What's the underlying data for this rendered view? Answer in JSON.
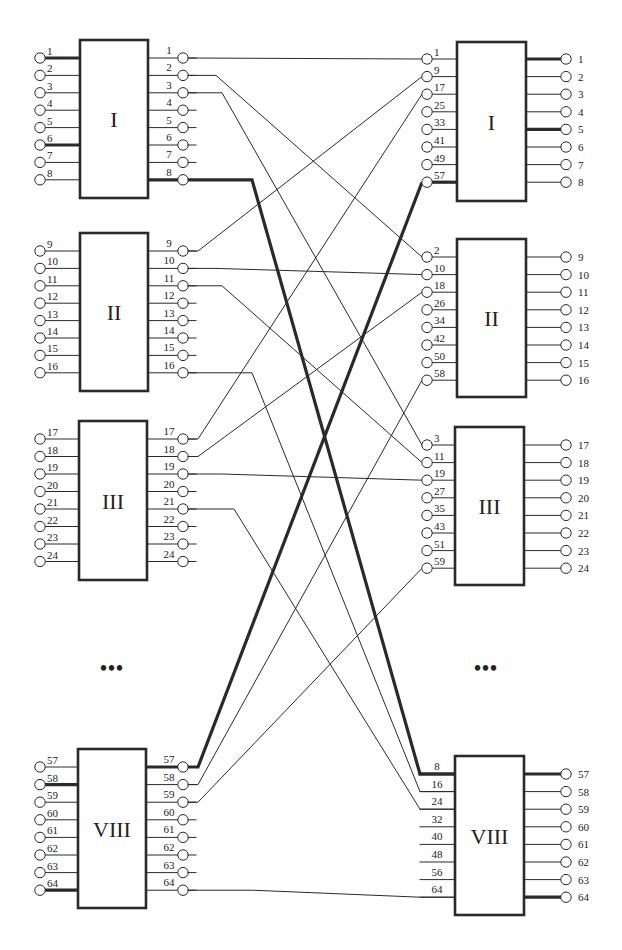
{
  "diagram": {
    "title": "",
    "colors": {
      "stroke": "#2a2a2a",
      "background": "#ffffff"
    },
    "ellipsis": "•••",
    "left_blocks": [
      {
        "label": "I",
        "box": [
          80,
          40,
          148,
          198
        ],
        "first": 58,
        "step": 17.4,
        "inputs": [
          1,
          2,
          3,
          4,
          5,
          6,
          7,
          8
        ],
        "outputs": [
          1,
          2,
          3,
          4,
          5,
          6,
          7,
          8
        ],
        "thick_in": [
          1,
          6
        ],
        "thick_out": [
          8
        ]
      },
      {
        "label": "II",
        "box": [
          80,
          233,
          148,
          391
        ],
        "first": 251,
        "step": 17.4,
        "inputs": [
          9,
          10,
          11,
          12,
          13,
          14,
          15,
          16
        ],
        "outputs": [
          9,
          10,
          11,
          12,
          13,
          14,
          15,
          16
        ],
        "thick_in": [],
        "thick_out": []
      },
      {
        "label": "III",
        "box": [
          79,
          421,
          147,
          580
        ],
        "first": 439,
        "step": 17.5,
        "inputs": [
          17,
          18,
          19,
          20,
          21,
          22,
          23,
          24
        ],
        "outputs": [
          17,
          18,
          19,
          20,
          21,
          22,
          23,
          24
        ],
        "thick_in": [],
        "thick_out": []
      },
      {
        "label": "VIII",
        "box": [
          78,
          749,
          146,
          908
        ],
        "first": 767,
        "step": 17.6,
        "inputs": [
          57,
          58,
          59,
          60,
          61,
          62,
          63,
          64
        ],
        "outputs": [
          57,
          58,
          59,
          60,
          61,
          62,
          63,
          64
        ],
        "thick_in": [
          58,
          64
        ],
        "thick_out": [
          57
        ]
      }
    ],
    "right_blocks": [
      {
        "label": "I",
        "box": [
          457,
          42,
          526,
          201
        ],
        "first": 59,
        "step": 17.6,
        "inputs": [
          1,
          9,
          17,
          25,
          33,
          41,
          49,
          57
        ],
        "outputs": [
          1,
          2,
          3,
          4,
          5,
          6,
          7,
          8
        ],
        "thick_in": [
          57
        ],
        "thick_out": [
          1,
          5
        ],
        "input_circles": true
      },
      {
        "label": "II",
        "box": [
          457,
          239,
          526,
          397
        ],
        "first": 257,
        "step": 17.6,
        "inputs": [
          2,
          10,
          18,
          26,
          34,
          42,
          50,
          58
        ],
        "outputs": [
          9,
          10,
          11,
          12,
          13,
          14,
          15,
          16
        ],
        "thick_in": [],
        "thick_out": [],
        "input_circles": true
      },
      {
        "label": "III",
        "box": [
          455,
          427,
          524,
          585
        ],
        "first": 445,
        "step": 17.6,
        "inputs": [
          3,
          11,
          19,
          27,
          35,
          43,
          51,
          59
        ],
        "outputs": [
          17,
          18,
          19,
          20,
          21,
          22,
          23,
          24
        ],
        "thick_in": [],
        "thick_out": [],
        "input_circles": true
      },
      {
        "label": "VIII",
        "box": [
          455,
          756,
          524,
          915
        ],
        "first": 774,
        "step": 17.6,
        "inputs": [
          8,
          16,
          24,
          32,
          40,
          48,
          56,
          64
        ],
        "outputs": [
          57,
          58,
          59,
          60,
          61,
          62,
          63,
          64
        ],
        "thick_in": [
          8
        ],
        "thick_out": [
          57,
          64
        ],
        "input_circles": false
      }
    ],
    "connections": [
      {
        "from": [
          0,
          0
        ],
        "to": [
          0,
          0
        ],
        "thick": false
      },
      {
        "from": [
          0,
          1
        ],
        "to": [
          1,
          0
        ],
        "thick": false
      },
      {
        "from": [
          0,
          2
        ],
        "to": [
          2,
          0
        ],
        "thick": false
      },
      {
        "from": [
          0,
          7
        ],
        "to": [
          3,
          0
        ],
        "thick": true
      },
      {
        "from": [
          1,
          0
        ],
        "to": [
          0,
          1
        ],
        "thick": false
      },
      {
        "from": [
          1,
          1
        ],
        "to": [
          1,
          1
        ],
        "thick": false
      },
      {
        "from": [
          1,
          2
        ],
        "to": [
          2,
          1
        ],
        "thick": false
      },
      {
        "from": [
          1,
          7
        ],
        "to": [
          3,
          1
        ],
        "thick": false
      },
      {
        "from": [
          2,
          0
        ],
        "to": [
          0,
          2
        ],
        "thick": false
      },
      {
        "from": [
          2,
          1
        ],
        "to": [
          1,
          2
        ],
        "thick": false
      },
      {
        "from": [
          2,
          2
        ],
        "to": [
          2,
          2
        ],
        "thick": false
      },
      {
        "from": [
          2,
          4
        ],
        "to": [
          3,
          2
        ],
        "thick": false
      },
      {
        "from": [
          3,
          0
        ],
        "to": [
          0,
          7
        ],
        "thick": true
      },
      {
        "from": [
          3,
          1
        ],
        "to": [
          1,
          7
        ],
        "thick": false
      },
      {
        "from": [
          3,
          2
        ],
        "to": [
          2,
          7
        ],
        "thick": false
      },
      {
        "from": [
          3,
          7
        ],
        "to": [
          3,
          7
        ],
        "thick": false
      }
    ]
  }
}
